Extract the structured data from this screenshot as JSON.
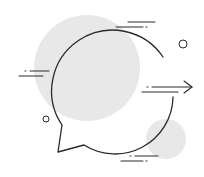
{
  "illustration": {
    "subject": "speech-bubble-with-arrow",
    "colors": {
      "background": "#ffffff",
      "blob": "#e8e8e8",
      "stroke": "#2a2a2a"
    },
    "icons": [
      "speech-bubble-icon",
      "arrow-right-icon",
      "motion-lines",
      "decorative-circles"
    ]
  }
}
